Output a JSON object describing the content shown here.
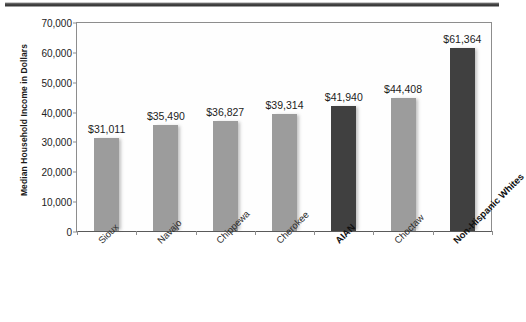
{
  "chart_data": {
    "type": "bar",
    "title": "",
    "xlabel": "",
    "ylabel": "Median Household Income in Dollars",
    "categories": [
      "Sioux",
      "Navajo",
      "Chippewa",
      "Cherokee",
      "AIAN",
      "Choctaw",
      "Non-Hispanic Whites"
    ],
    "values": [
      31011,
      35490,
      36827,
      39314,
      41940,
      44408,
      61364
    ],
    "value_labels": [
      "$31,011",
      "$35,490",
      "$36,827",
      "$39,314",
      "$41,940",
      "$44,408",
      "$61,364"
    ],
    "emphasis": [
      false,
      false,
      false,
      false,
      true,
      false,
      true
    ],
    "ylim": [
      0,
      70000
    ],
    "ytick_labels": [
      "70,000",
      "60,000",
      "50,000",
      "40,000",
      "30,000",
      "20,000",
      "10,000",
      "0"
    ],
    "ytick_values": [
      70000,
      60000,
      50000,
      40000,
      30000,
      20000,
      10000,
      0
    ],
    "grid": false,
    "legend": "none",
    "colors": {
      "bar_light": "#9c9c9c",
      "bar_dark": "#404040",
      "axis": "#8d8d8d",
      "text": "#1c1c1c",
      "background": "#ffffff"
    }
  }
}
